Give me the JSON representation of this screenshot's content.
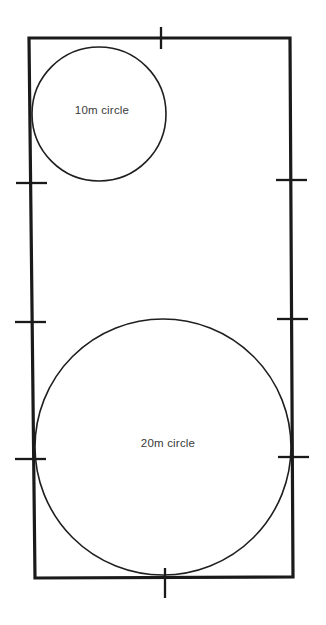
{
  "diagram": {
    "background_color": "#ffffff",
    "line_color": "#1a1a1a",
    "label_color": "#3a3a3a",
    "pitch": {
      "name": "pitch-boundary",
      "corners": {
        "top_left": [
          29,
          38
        ],
        "top_right": [
          290,
          38
        ],
        "bottom_right": [
          293,
          577
        ],
        "bottom_left": [
          35,
          578
        ]
      }
    },
    "circles": [
      {
        "name": "10m-circle",
        "label": "10m circle",
        "center_x": 99,
        "center_y": 114,
        "radius": 67,
        "label_x": 102,
        "label_y": 111
      },
      {
        "name": "20m-circle",
        "label": "20m circle",
        "center_x": 163,
        "center_y": 447,
        "radius": 128,
        "label_x": 168,
        "label_y": 444
      }
    ],
    "tick_marks": [
      {
        "name": "tick-top-center",
        "edge": "top",
        "x1": 161,
        "y1": 27,
        "x2": 161,
        "y2": 49
      },
      {
        "name": "tick-bottom-center",
        "edge": "bottom",
        "x1": 165,
        "y1": 568,
        "x2": 165,
        "y2": 598
      },
      {
        "name": "tick-left-upper",
        "edge": "left",
        "x1": 16,
        "y1": 183,
        "x2": 47,
        "y2": 183
      },
      {
        "name": "tick-left-middle",
        "edge": "left",
        "x1": 15,
        "y1": 322,
        "x2": 46,
        "y2": 322
      },
      {
        "name": "tick-left-lower",
        "edge": "left",
        "x1": 15,
        "y1": 459,
        "x2": 46,
        "y2": 459
      },
      {
        "name": "tick-right-upper",
        "edge": "right",
        "x1": 276,
        "y1": 180,
        "x2": 307,
        "y2": 180
      },
      {
        "name": "tick-right-middle",
        "edge": "right",
        "x1": 277,
        "y1": 319,
        "x2": 308,
        "y2": 319
      },
      {
        "name": "tick-right-lower",
        "edge": "right",
        "x1": 278,
        "y1": 457,
        "x2": 309,
        "y2": 457
      }
    ]
  }
}
